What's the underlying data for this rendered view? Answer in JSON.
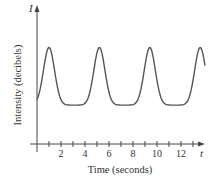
{
  "chart_data": {
    "type": "line",
    "title": "",
    "xlabel": "Time (seconds)",
    "ylabel": "Intensity (decibels)",
    "x_axis_var": "t",
    "y_axis_var": "I",
    "x_ticks": [
      2,
      4,
      6,
      8,
      10,
      12
    ],
    "x_minor_ticks": [
      1,
      3,
      5,
      7,
      9,
      11,
      13
    ],
    "xlim": [
      0,
      14.2
    ],
    "y_ticks": [],
    "grid": false,
    "legend": null,
    "series": [
      {
        "name": "Intensity",
        "description": "Periodic pulses: sharp peaks near t = 1, 5.2, 9.4, 13.6 s; broad rounded troughs between peaks",
        "period_seconds": 4.2,
        "peak_times": [
          1.0,
          5.2,
          9.4,
          13.6
        ],
        "trough_times": [
          3.1,
          7.3,
          11.5
        ],
        "relative_peak_level": 0.72,
        "relative_trough_level": 0.29,
        "relative_start_level": 0.34,
        "color": "#555555"
      }
    ]
  },
  "labels": {
    "x_axis": "Time (seconds)",
    "y_axis": "Intensity (decibels)",
    "x_var": "t",
    "y_var": "I",
    "ticks": [
      "2",
      "4",
      "6",
      "8",
      "10",
      "12"
    ]
  }
}
